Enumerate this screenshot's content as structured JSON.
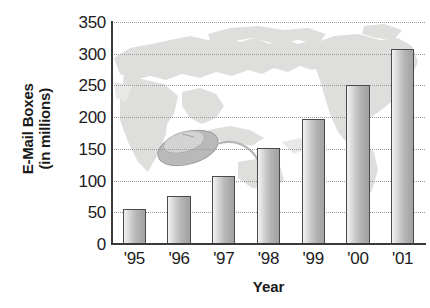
{
  "chart_data": {
    "type": "bar",
    "title": "",
    "subtitle": "",
    "xlabel": "Year",
    "ylabel": "E-Mail Boxes (in millions)",
    "ylabel_lines": [
      "E-Mail Boxes",
      "(in millions)"
    ],
    "categories": [
      "'95",
      "'96",
      "'97",
      "'98",
      "'99",
      "'00",
      "'01"
    ],
    "values": [
      55,
      75,
      107,
      151,
      197,
      250,
      307
    ],
    "series": [
      {
        "name": "E-Mail Boxes",
        "values": [
          55,
          75,
          107,
          151,
          197,
          250,
          307
        ]
      }
    ],
    "ylim": [
      0,
      350
    ],
    "ytick_labels": [
      "0",
      "50",
      "100",
      "150",
      "200",
      "250",
      "300",
      "350"
    ],
    "ytick_values": [
      0,
      50,
      100,
      150,
      200,
      250,
      300,
      350
    ],
    "grid": true,
    "grid_style": "dotted-horizontal",
    "legend": false,
    "legend_position": "none",
    "annotations": [
      {
        "name": "world-map-watermark",
        "description": "pale gray world map silhouette behind the plot area"
      },
      {
        "name": "computer-mouse-illustration",
        "description": "small gray computer mouse with cable drawn over the map"
      }
    ],
    "colors": {
      "bar_fill_light": "#e6e6e6",
      "bar_fill_dark": "#a2a2a2",
      "bar_outline": "#4a4a4a",
      "axis": "#3a3a3a",
      "gridline": "#9a9a9a",
      "text": "#1c1c1c",
      "map_watermark": "#dcdcdc",
      "background": "#ffffff"
    }
  }
}
